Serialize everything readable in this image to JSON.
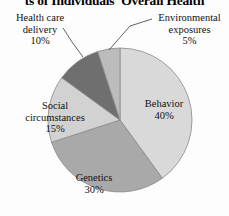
{
  "title": "ts of Individuals' Overall Health",
  "chart_data": {
    "type": "pie",
    "title": "ts of Individuals' Overall Health",
    "categories": [
      "Behavior",
      "Genetics",
      "Social circumstances",
      "Health care delivery",
      "Environmental exposures"
    ],
    "values": [
      40,
      30,
      15,
      10,
      5
    ],
    "value_unit": "percent",
    "start_angle_deg": 0,
    "direction": "clockwise",
    "legend": "none",
    "grid": false,
    "slices": [
      {
        "label": "Behavior",
        "percent_text": "40%",
        "value": 40,
        "color": "#d9d9d9",
        "label_placement": "inside"
      },
      {
        "label": "Genetics",
        "percent_text": "30%",
        "value": 30,
        "color": "#a9a9a9",
        "label_placement": "inside"
      },
      {
        "label": "Social circumstances",
        "label_line1": "Social",
        "label_line2": "circumstances",
        "percent_text": "15%",
        "value": 15,
        "color": "#d2d2d2",
        "label_placement": "inside"
      },
      {
        "label": "Health care delivery",
        "label_line1": "Health care",
        "label_line2": "delivery",
        "percent_text": "10%",
        "value": 10,
        "color": "#6f6f6f",
        "label_placement": "outside-left",
        "has_leader_line": true
      },
      {
        "label": "Environmental exposures",
        "label_line1": "Environmental",
        "label_line2": "exposures",
        "percent_text": "5%",
        "value": 5,
        "color": "#bcbcbc",
        "label_placement": "outside-right",
        "has_leader_line": true
      }
    ],
    "colors": {
      "behavior": "#d9d9d9",
      "genetics": "#a9a9a9",
      "social_circumstances": "#d2d2d2",
      "health_care_delivery": "#6f6f6f",
      "environmental_exposures": "#bcbcbc",
      "outline": "#8a8a8a",
      "text": "#111111",
      "background": "#fdfdfd"
    }
  }
}
